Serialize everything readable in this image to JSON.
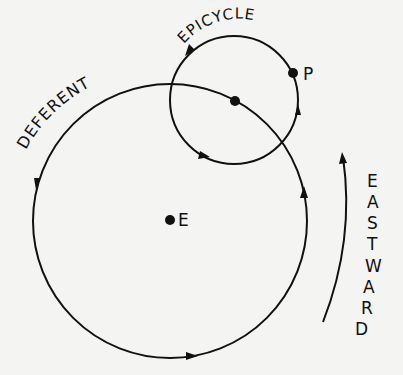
{
  "diagram": {
    "labels": {
      "epicycle": "EPICYCLE",
      "deferent": "DEFERENT",
      "planet": "P",
      "earth": "E",
      "direction": [
        "E",
        "A",
        "S",
        "T",
        "W",
        "A",
        "R",
        "D"
      ]
    },
    "stroke_color": "#111111",
    "background_color": "#f4f4f2"
  }
}
